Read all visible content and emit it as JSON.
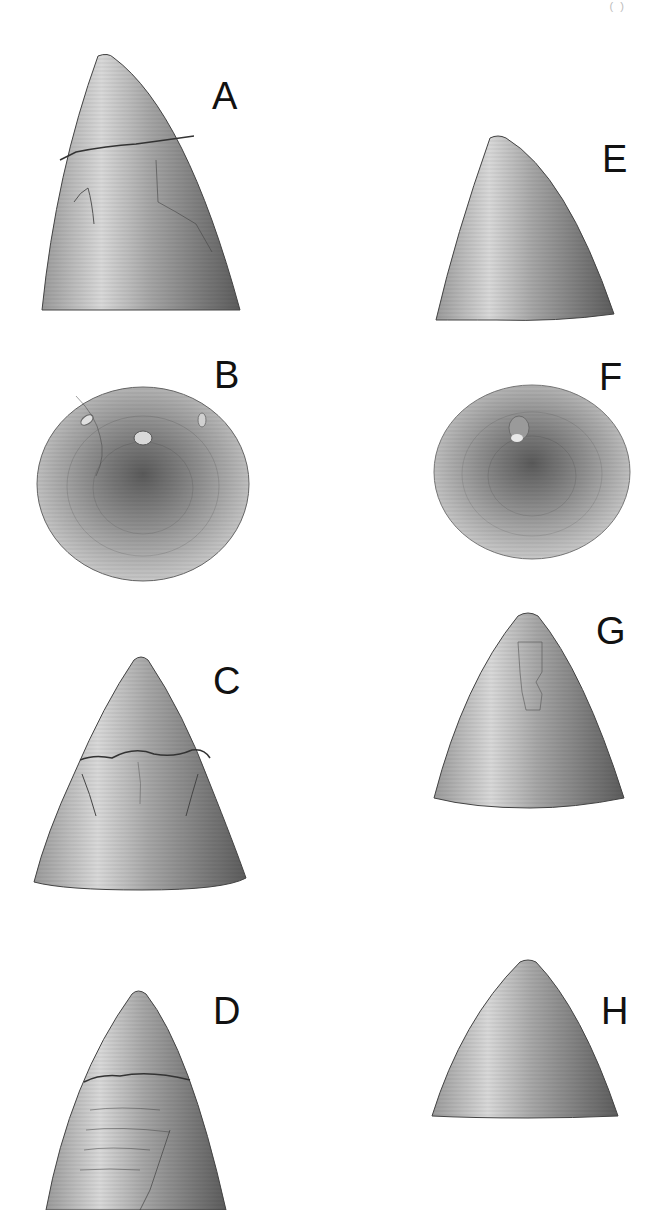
{
  "plate": {
    "header_mark": "(   )",
    "panels": [
      {
        "id": "A",
        "label": "A",
        "view": "lateral",
        "shape": "curved-cone",
        "features": [
          "apical-cap",
          "fracture-line"
        ]
      },
      {
        "id": "B",
        "label": "B",
        "view": "apical",
        "shape": "disc",
        "features": [
          "central-nub",
          "concentric-growth-lines"
        ]
      },
      {
        "id": "C",
        "label": "C",
        "view": "lateral",
        "shape": "cone",
        "features": [
          "apical-cap",
          "fracture-line",
          "lateral-scars"
        ]
      },
      {
        "id": "D",
        "label": "D",
        "view": "lateral",
        "shape": "elongate-cone",
        "features": [
          "apical-cap",
          "cracked-surface"
        ]
      },
      {
        "id": "E",
        "label": "E",
        "view": "lateral",
        "shape": "curved-cone",
        "features": [
          "growth-lines"
        ]
      },
      {
        "id": "F",
        "label": "F",
        "view": "apical",
        "shape": "disc",
        "features": [
          "central-nub",
          "concentric-growth-lines"
        ]
      },
      {
        "id": "G",
        "label": "G",
        "view": "lateral",
        "shape": "cone",
        "features": [
          "apical-scar",
          "growth-lines"
        ]
      },
      {
        "id": "H",
        "label": "H",
        "view": "lateral",
        "shape": "cone",
        "features": [
          "growth-lines"
        ]
      }
    ]
  }
}
